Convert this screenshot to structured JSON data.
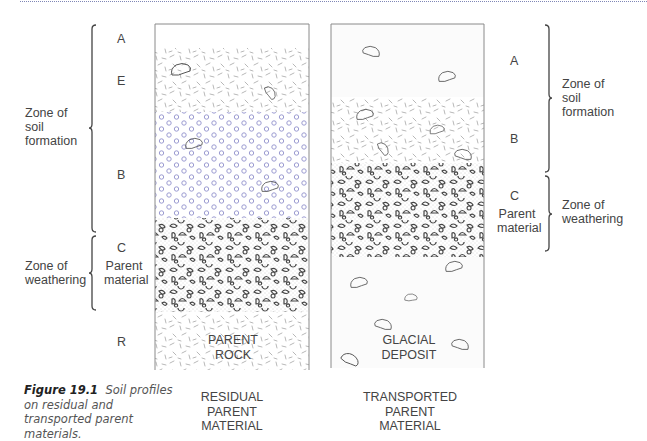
{
  "figure": {
    "number": "Figure 19.1",
    "caption": "Soil profiles on residual and transported parent materials."
  },
  "left_profile": {
    "title_lines": [
      "RESIDUAL",
      "PARENT",
      "MATERIAL"
    ],
    "inner_label_lines": [
      "PARENT",
      "ROCK"
    ],
    "horizons": [
      {
        "label": "A",
        "y_top": 24,
        "y_bottom": 48,
        "fill": "plain"
      },
      {
        "label": "E",
        "y_top": 48,
        "y_bottom": 112,
        "fill": "dashes"
      },
      {
        "label": "B",
        "y_top": 112,
        "y_bottom": 218,
        "fill": "circles"
      },
      {
        "label": "C",
        "sublabel": "Parent material",
        "y_top": 218,
        "y_bottom": 312,
        "fill": "pebbles"
      },
      {
        "label": "R",
        "y_top": 312,
        "y_bottom": 370,
        "fill": "dashes"
      }
    ],
    "zones": [
      {
        "label_lines": [
          "Zone of",
          "soil",
          "formation"
        ],
        "y_top": 25,
        "y_bottom": 232
      },
      {
        "label_lines": [
          "Zone of",
          "weathering"
        ],
        "y_top": 236,
        "y_bottom": 310
      }
    ]
  },
  "right_profile": {
    "title_lines": [
      "TRANSPORTED",
      "PARENT",
      "MATERIAL"
    ],
    "inner_label_lines": [
      "GLACIAL",
      "DEPOSIT"
    ],
    "horizons": [
      {
        "label": "A",
        "y_top": 24,
        "y_bottom": 97,
        "fill": "plain"
      },
      {
        "label": "B",
        "y_top": 97,
        "y_bottom": 163,
        "fill": "dashes"
      },
      {
        "label": "C",
        "sublabel": "Parent material",
        "y_top": 163,
        "y_bottom": 257,
        "fill": "pebbles"
      },
      {
        "label": "",
        "y_top": 257,
        "y_bottom": 368,
        "fill": "plain"
      }
    ],
    "zones": [
      {
        "label_lines": [
          "Zone of",
          "soil",
          "formation"
        ],
        "y_top": 25,
        "y_bottom": 172
      },
      {
        "label_lines": [
          "Zone of",
          "weathering"
        ],
        "y_top": 176,
        "y_bottom": 251
      }
    ]
  },
  "labels": {
    "A": "A",
    "E": "E",
    "B": "B",
    "C": "C",
    "R": "R",
    "parent": "Parent",
    "material": "material",
    "zone_of": "Zone of",
    "soil": "soil",
    "formation": "formation",
    "weathering": "weathering"
  },
  "colors": {
    "outline": "#8a8a8a",
    "circles": "#9a9ad0",
    "dashes": "#b4b4b4",
    "pebbles": "#4a4a4a",
    "stipple": "#9a9a9a",
    "topline": "#7f86b6"
  }
}
